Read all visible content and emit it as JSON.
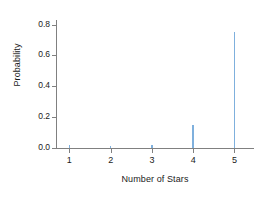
{
  "chart_data": {
    "type": "bar",
    "subtype": "stem-spike-pmf",
    "title": "",
    "subtitle": "",
    "xlabel": "Number of Stars",
    "ylabel": "Probability",
    "categories": [
      "1",
      "2",
      "3",
      "4",
      "5"
    ],
    "x": [
      1,
      2,
      3,
      4,
      5
    ],
    "values": [
      0.02,
      0.01,
      0.02,
      0.15,
      0.75
    ],
    "series": [
      {
        "name": "Probability",
        "values": [
          0.02,
          0.01,
          0.02,
          0.15,
          0.75
        ]
      }
    ],
    "xlim": [
      0.7,
      5.45
    ],
    "ylim": [
      0.0,
      0.83
    ],
    "ytick_labels": [
      "0.0",
      "0.2",
      "0.4",
      "0.6",
      "0.8"
    ],
    "ytick_values": [
      0.0,
      0.2,
      0.4,
      0.6,
      0.8
    ],
    "xtick_labels": [
      "1",
      "2",
      "3",
      "4",
      "5"
    ],
    "xtick_values": [
      1,
      2,
      3,
      4,
      5
    ],
    "grid": false,
    "legend": false,
    "legend_position": "none",
    "colors": {
      "spike": "#7fb0dd",
      "axis": "#808080",
      "text": "#1a1a1a",
      "background": "#ffffff"
    }
  }
}
